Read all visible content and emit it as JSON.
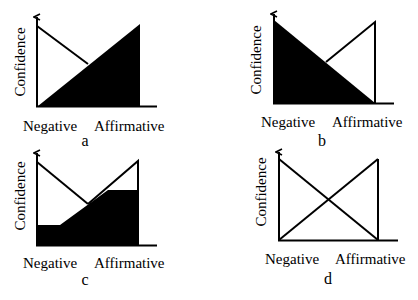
{
  "figure": {
    "panels": [
      {
        "id": "a",
        "letter": "a",
        "y_label": "Confidence",
        "x_labels": [
          "Negative",
          "Affirmative"
        ],
        "description": "Negative confidence line decreases from high (left) to zero; affirmative region filled black, rising linearly from zero at Negative to maximum at Affirmative"
      },
      {
        "id": "b",
        "letter": "b",
        "y_label": "Confidence",
        "x_labels": [
          "Negative",
          "Affirmative"
        ],
        "description": "Negative region filled black, decreasing linearly from maximum to zero; affirmative line outline rising to maximum at Affirmative"
      },
      {
        "id": "c",
        "letter": "c",
        "y_label": "Confidence",
        "x_labels": [
          "Negative",
          "Affirmative"
        ],
        "description": "Filled region clipped: flat low floor at left, rising linear section, flat ceiling at right below affirmative peak; negative line decreasing"
      },
      {
        "id": "d",
        "letter": "d",
        "y_label": "Confidence",
        "x_labels": [
          "Negative",
          "Affirmative"
        ],
        "description": "Two crossing lines, no fill: negative decreasing, affirmative increasing"
      }
    ],
    "colors": {
      "ink": "#000000",
      "background": "#ffffff"
    }
  }
}
